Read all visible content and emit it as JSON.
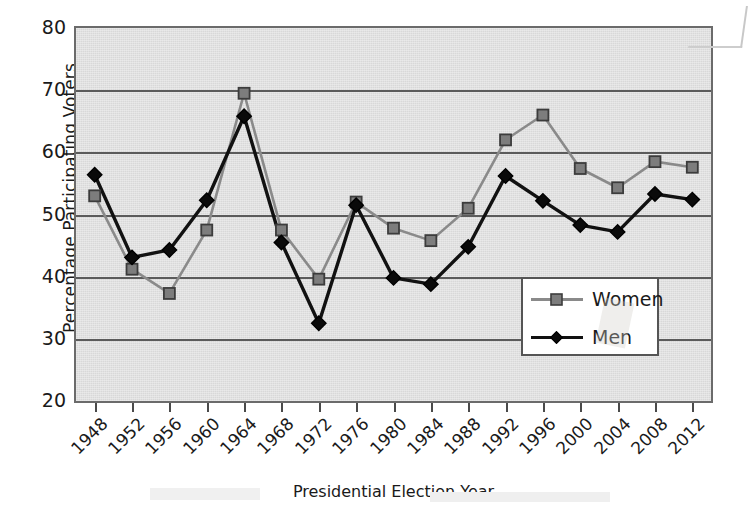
{
  "chart_data": {
    "type": "line",
    "title": "",
    "xlabel": "Presidential Election Year",
    "ylabel": "Percentage Participating Voters",
    "ylim": [
      20,
      80
    ],
    "yticks": [
      80,
      70,
      60,
      50,
      40,
      30,
      20
    ],
    "grid": true,
    "grid_axis": "y",
    "legend_position": "center-right-inside",
    "plot_background_color": "#d8d8d8",
    "categories": [
      1948,
      1952,
      1956,
      1960,
      1964,
      1968,
      1972,
      1976,
      1980,
      1984,
      1988,
      1992,
      1996,
      2000,
      2004,
      2008,
      2012
    ],
    "x": [
      "1948",
      "1952",
      "1956",
      "1960",
      "1964",
      "1968",
      "1972",
      "1976",
      "1980",
      "1984",
      "1988",
      "1992",
      "1996",
      "2000",
      "2004",
      "2008",
      "2012"
    ],
    "series": [
      {
        "name": "Women",
        "color": "#8a8a8a",
        "marker": "square",
        "marker_color": "#7d7d7d",
        "values": [
          53.0,
          41.2,
          37.3,
          47.5,
          69.5,
          47.5,
          39.6,
          52.0,
          47.8,
          45.8,
          51.0,
          62.0,
          66.0,
          57.4,
          54.3,
          58.5,
          57.6
        ]
      },
      {
        "name": "Men",
        "color": "#111111",
        "marker": "diamond",
        "marker_color": "#0a0a0a",
        "values": [
          56.4,
          43.1,
          44.3,
          52.3,
          65.8,
          45.5,
          32.5,
          51.5,
          39.8,
          38.8,
          44.8,
          56.2,
          52.2,
          48.3,
          47.2,
          53.3,
          52.4
        ]
      }
    ]
  },
  "axis": {
    "y_title": "Percentage Participating Voters",
    "x_title": "Presidential Election Year",
    "y_tick_labels": [
      "80",
      "70",
      "60",
      "50",
      "40",
      "30",
      "20"
    ],
    "x_tick_labels": [
      "1948",
      "1952",
      "1956",
      "1960",
      "1964",
      "1968",
      "1972",
      "1976",
      "1980",
      "1984",
      "1988",
      "1992",
      "1996",
      "2000",
      "2004",
      "2008",
      "2012"
    ]
  },
  "legend": {
    "entries": [
      {
        "label": "Women",
        "color": "#8a8a8a",
        "marker": "square"
      },
      {
        "label": "Men",
        "color": "#111111",
        "marker": "diamond"
      }
    ],
    "women_label": "Women",
    "men_label": "Men"
  },
  "colors": {
    "women_series": "#8a8a8a",
    "men_series": "#111111",
    "plot_background": "#d8d8d8",
    "gridline": "#5b5b5b",
    "plot_border": "#6b6b6b",
    "page_background": "#ffffff",
    "text": "#1a1a1a"
  }
}
